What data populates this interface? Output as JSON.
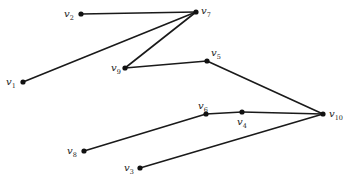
{
  "diagram": {
    "type": "graph",
    "colors": {
      "edge": "#1a1a1a",
      "node": "#111111",
      "label": "#222222",
      "background": "#ffffff"
    },
    "nodes": [
      {
        "id": "v1",
        "label": "v",
        "sub": "1",
        "x": 23,
        "y": 82,
        "lx": 6,
        "ly": 85
      },
      {
        "id": "v2",
        "label": "v",
        "sub": "2",
        "x": 81,
        "y": 14,
        "lx": 64,
        "ly": 17
      },
      {
        "id": "v3",
        "label": "v",
        "sub": "3",
        "x": 140,
        "y": 168,
        "lx": 124,
        "ly": 171
      },
      {
        "id": "v4",
        "label": "v",
        "sub": "4",
        "x": 242,
        "y": 112,
        "lx": 237,
        "ly": 125
      },
      {
        "id": "v5",
        "label": "v",
        "sub": "5",
        "x": 207,
        "y": 61,
        "lx": 211,
        "ly": 56
      },
      {
        "id": "v6",
        "label": "v",
        "sub": "6",
        "x": 206,
        "y": 114,
        "lx": 198,
        "ly": 109
      },
      {
        "id": "v7",
        "label": "v",
        "sub": "7",
        "x": 196,
        "y": 12,
        "lx": 201,
        "ly": 14
      },
      {
        "id": "v8",
        "label": "v",
        "sub": "8",
        "x": 84,
        "y": 151,
        "lx": 67,
        "ly": 154
      },
      {
        "id": "v9",
        "label": "v",
        "sub": "9",
        "x": 125,
        "y": 68,
        "lx": 111,
        "ly": 71
      },
      {
        "id": "v10",
        "label": "v",
        "sub": "10",
        "x": 323,
        "y": 114,
        "lx": 329,
        "ly": 117
      }
    ],
    "edges": [
      {
        "from": "v2",
        "to": "v7"
      },
      {
        "from": "v1",
        "to": "v7"
      },
      {
        "from": "v7",
        "to": "v9"
      },
      {
        "from": "v9",
        "to": "v5"
      },
      {
        "from": "v5",
        "to": "v10"
      },
      {
        "from": "v8",
        "to": "v6"
      },
      {
        "from": "v6",
        "to": "v4"
      },
      {
        "from": "v4",
        "to": "v10"
      },
      {
        "from": "v3",
        "to": "v10"
      }
    ]
  }
}
